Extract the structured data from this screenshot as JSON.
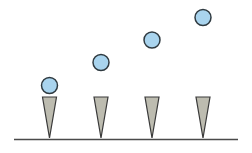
{
  "diagram": {
    "colors": {
      "background": "#ffffff",
      "ground_line": "#4a4a4a",
      "cone_fill": "#bdbcb0",
      "cone_stroke": "#3a3a3a",
      "ball_fill": "#a9d4ee",
      "ball_stroke": "#2f3a40"
    },
    "ground": {
      "x1": 14,
      "x2": 238,
      "y": 139.5
    },
    "cones": [
      {
        "cx": 49.5,
        "top_y": 97,
        "bottom_y": 138,
        "half_width": 7
      },
      {
        "cx": 101,
        "top_y": 97,
        "bottom_y": 138,
        "half_width": 7
      },
      {
        "cx": 152,
        "top_y": 97,
        "bottom_y": 138,
        "half_width": 7
      },
      {
        "cx": 203,
        "top_y": 97,
        "bottom_y": 138,
        "half_width": 7
      }
    ],
    "balls": [
      {
        "cx": 49.5,
        "cy": 85.5,
        "r": 8
      },
      {
        "cx": 101,
        "cy": 62.5,
        "r": 8
      },
      {
        "cx": 152,
        "cy": 40,
        "r": 8
      },
      {
        "cx": 203,
        "cy": 17.5,
        "r": 8
      }
    ]
  }
}
